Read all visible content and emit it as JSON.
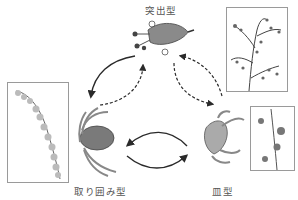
{
  "diagram": {
    "types": [
      {
        "id": "protruding",
        "label": "突出型"
      },
      {
        "id": "surrounding",
        "label": "取り囲み型"
      },
      {
        "id": "dish",
        "label": "皿型"
      }
    ],
    "photos": [
      {
        "id": "photo-protruding-inflorescence",
        "for": "protruding"
      },
      {
        "id": "photo-surrounding-inflorescence",
        "for": "surrounding"
      },
      {
        "id": "photo-dish-inflorescence",
        "for": "dish"
      }
    ],
    "arrows": [
      {
        "from": "protruding",
        "to": "surrounding",
        "style": "solid"
      },
      {
        "from": "surrounding",
        "to": "protruding",
        "style": "dashed"
      },
      {
        "from": "protruding",
        "to": "dish",
        "style": "dashed",
        "bidirectional": true
      },
      {
        "from": "dish",
        "to": "surrounding",
        "style": "solid"
      },
      {
        "from": "surrounding",
        "to": "dish",
        "style": "solid"
      }
    ],
    "colors": {
      "arrow": "#2a2a2a",
      "frame": "#9a9a9a",
      "label": "#555555"
    }
  }
}
